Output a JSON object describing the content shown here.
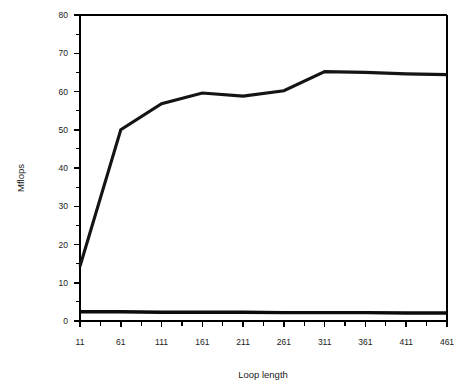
{
  "chart_data": {
    "type": "line",
    "title": "",
    "xlabel": "Loop length",
    "ylabel": "Mflops",
    "xlim": [
      11,
      461
    ],
    "ylim": [
      0,
      80
    ],
    "grid": false,
    "legend": "none",
    "x_ticks_major": [
      11,
      61,
      111,
      161,
      211,
      261,
      311,
      361,
      411,
      461
    ],
    "x_tick_labels": [
      "11",
      "61",
      "111",
      "161",
      "211",
      "261",
      "311",
      "361",
      "411",
      "461"
    ],
    "x_ticks_minor": [
      36,
      86,
      136,
      186,
      236,
      286,
      336,
      386,
      436
    ],
    "y_ticks_major": [
      0,
      10,
      20,
      30,
      40,
      50,
      60,
      70,
      80
    ],
    "y_tick_labels": [
      "0",
      "10",
      "20",
      "30",
      "40",
      "50",
      "60",
      "70",
      "80"
    ],
    "y_ticks_minor": [
      5,
      15,
      25,
      35,
      45,
      55,
      65,
      75
    ],
    "x": [
      11,
      61,
      111,
      161,
      211,
      261,
      311,
      361,
      411,
      461
    ],
    "series": [
      {
        "name": "upper-curve",
        "color": "#141414",
        "values": [
          14.3,
          50.0,
          56.8,
          59.6,
          58.8,
          60.2,
          65.2,
          65.0,
          64.6,
          64.4
        ]
      },
      {
        "name": "lower-flat",
        "color": "#0b0b0b",
        "values": [
          2.4,
          2.4,
          2.3,
          2.3,
          2.3,
          2.2,
          2.2,
          2.2,
          2.1,
          2.1
        ]
      }
    ]
  },
  "labels": {
    "y_axis_title": "Mflops",
    "x_axis_title": "Loop length"
  }
}
